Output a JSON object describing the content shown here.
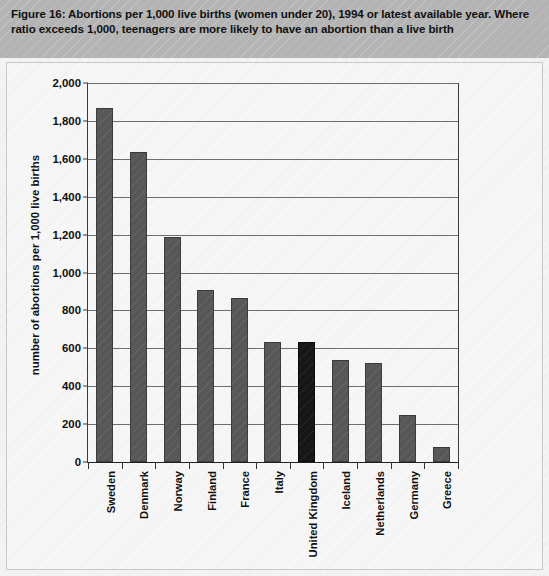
{
  "figure": {
    "caption": "Figure 16:  Abortions per 1,000 live births (women under 20), 1994 or latest available year. Where ratio exceeds 1,000, teenagers are more likely to have an abortion than a live birth"
  },
  "colors": {
    "bar": "#575757",
    "highlight_bar": "#161616",
    "caption_banner": "#b4b4b4",
    "panel_background": "#f6f6f6",
    "gridline": "#6e6e6e",
    "axis": "#222222"
  },
  "chart_data": {
    "type": "bar",
    "title": "Abortions per 1,000 live births (women under 20), 1994 or latest available year",
    "xlabel": "",
    "ylabel": "number of abortions per 1,000 live births",
    "ylim": [
      0,
      2000
    ],
    "ytick_values": [
      0,
      200,
      400,
      600,
      800,
      1000,
      1200,
      1400,
      1600,
      1800,
      2000
    ],
    "ytick_labels": [
      "0",
      "200",
      "400",
      "600",
      "800",
      "1,000",
      "1,200",
      "1,400",
      "1,600",
      "1,800",
      "2,000"
    ],
    "grid": true,
    "legend": false,
    "highlight_category": "United Kingdom",
    "categories": [
      "Sweden",
      "Denmark",
      "Norway",
      "Finland",
      "France",
      "Italy",
      "United Kingdom",
      "Iceland",
      "Netherlands",
      "Germany",
      "Greece"
    ],
    "values": [
      1870,
      1635,
      1190,
      910,
      865,
      635,
      635,
      540,
      525,
      250,
      80
    ]
  }
}
